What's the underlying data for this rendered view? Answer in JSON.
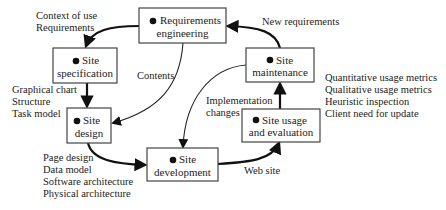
{
  "diagram": {
    "nodes": [
      {
        "id": 1,
        "number": "1",
        "line1": "Requirements",
        "line2": "engineering"
      },
      {
        "id": 2,
        "number": "2",
        "line1": "Site",
        "line2": "specification"
      },
      {
        "id": 3,
        "number": "3",
        "line1": "Site",
        "line2": "design"
      },
      {
        "id": 4,
        "number": "4",
        "line1": "Site",
        "line2": "development"
      },
      {
        "id": 5,
        "number": "5",
        "line1": "Site usage",
        "line2": "and evaluation"
      },
      {
        "id": 6,
        "number": "6",
        "line1": "Site",
        "line2": "maintenance"
      }
    ],
    "edges": [
      {
        "from": 1,
        "to": 2,
        "label": [
          "Context of use",
          "Requirements"
        ]
      },
      {
        "from": 2,
        "to": 3,
        "label": [
          "Graphical chart",
          "Structure",
          "Task model"
        ]
      },
      {
        "from": 3,
        "to": 4,
        "label": [
          "Page design",
          "Data model",
          "Software architecture",
          "Physical architecture"
        ]
      },
      {
        "from": 4,
        "to": 5,
        "label": [
          "Web site"
        ]
      },
      {
        "from": 5,
        "to": 6,
        "label": [
          "Quantitative usage metrics",
          "Qualitative usage metrics",
          "Heuristic inspection",
          "Client need for update"
        ]
      },
      {
        "from": 6,
        "to": 1,
        "label": [
          "New requirements"
        ]
      },
      {
        "from": 1,
        "to": 3,
        "label": [
          "Contents"
        ]
      },
      {
        "from": 6,
        "to": 4,
        "label": [
          "Implementation",
          "changes"
        ]
      }
    ]
  }
}
